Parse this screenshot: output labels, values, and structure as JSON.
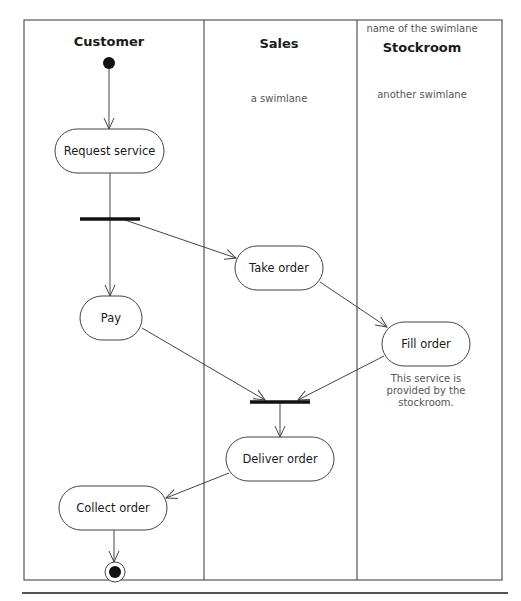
{
  "diagram": {
    "type": "uml-activity-diagram",
    "frame": {
      "x": 24,
      "y": 20,
      "w": 478,
      "h": 560
    },
    "swimlane_dividers": [
      204,
      357
    ],
    "bottom_rule": {
      "x1": 22,
      "x2": 508,
      "y": 593
    },
    "lanes": [
      {
        "id": "customer",
        "title": "Customer",
        "title_x": 109,
        "title_y": 46,
        "note": ""
      },
      {
        "id": "sales",
        "title": "Sales",
        "title_x": 279,
        "title_y": 48,
        "note": "a swimlane",
        "note_x": 279,
        "note_y": 102
      },
      {
        "id": "stockroom",
        "title": "Stockroom",
        "title_x": 422,
        "title_y": 52,
        "note": "another swimlane",
        "note_x": 422,
        "note_y": 98,
        "header_note": "name of the swimlane",
        "header_note_x": 422,
        "header_note_y": 32
      }
    ],
    "start": {
      "x": 109,
      "y": 63,
      "r": 6
    },
    "end": {
      "x": 115,
      "y": 572,
      "r_outer": 10,
      "r_inner": 6
    },
    "nodes": [
      {
        "id": "request-service",
        "label": "Request service",
        "x": 55,
        "y": 129,
        "w": 109,
        "h": 44
      },
      {
        "id": "take-order",
        "label": "Take order",
        "x": 235,
        "y": 246,
        "w": 88,
        "h": 44
      },
      {
        "id": "pay",
        "label": "Pay",
        "x": 80,
        "y": 296,
        "w": 62,
        "h": 44
      },
      {
        "id": "fill-order",
        "label": "Fill order",
        "x": 382,
        "y": 322,
        "w": 88,
        "h": 44
      },
      {
        "id": "deliver-order",
        "label": "Deliver order",
        "x": 226,
        "y": 437,
        "w": 108,
        "h": 44
      },
      {
        "id": "collect-order",
        "label": "Collect order",
        "x": 59,
        "y": 486,
        "w": 108,
        "h": 44
      }
    ],
    "bars": [
      {
        "id": "fork",
        "x1": 80,
        "x2": 140,
        "y": 219
      },
      {
        "id": "join",
        "x1": 250,
        "x2": 310,
        "y": 402
      }
    ],
    "edges": [
      {
        "from": "start",
        "to": "request-service",
        "x1": 109,
        "y1": 69,
        "x2": 109,
        "y2": 129
      },
      {
        "from": "request-service",
        "to": "fork",
        "x1": 110,
        "y1": 173,
        "x2": 110,
        "y2": 219,
        "arrow": false
      },
      {
        "from": "fork",
        "to": "pay",
        "x1": 110,
        "y1": 219,
        "x2": 110,
        "y2": 296
      },
      {
        "from": "fork",
        "to": "take-order",
        "x1": 122,
        "y1": 219,
        "x2": 236,
        "y2": 258
      },
      {
        "from": "take-order",
        "to": "fill-order",
        "x1": 320,
        "y1": 282,
        "x2": 387,
        "y2": 327
      },
      {
        "from": "pay",
        "to": "join",
        "x1": 142,
        "y1": 328,
        "x2": 265,
        "y2": 400
      },
      {
        "from": "fill-order",
        "to": "join",
        "x1": 384,
        "y1": 356,
        "x2": 298,
        "y2": 400
      },
      {
        "from": "join",
        "to": "deliver-order",
        "x1": 280,
        "y1": 403,
        "x2": 280,
        "y2": 437
      },
      {
        "from": "deliver-order",
        "to": "collect-order",
        "x1": 229,
        "y1": 473,
        "x2": 166,
        "y2": 498
      },
      {
        "from": "collect-order",
        "to": "end",
        "x1": 114,
        "y1": 530,
        "x2": 114,
        "y2": 562
      }
    ],
    "annotation": {
      "lines": [
        "This service is",
        "provided by the",
        "stockroom."
      ],
      "x": 426,
      "y": 382,
      "line_height": 12
    }
  },
  "colors": {
    "stroke": "#444444",
    "bar": "#111111",
    "text": "#1a1a1a",
    "muted_text": "#555555",
    "background": "#ffffff"
  }
}
